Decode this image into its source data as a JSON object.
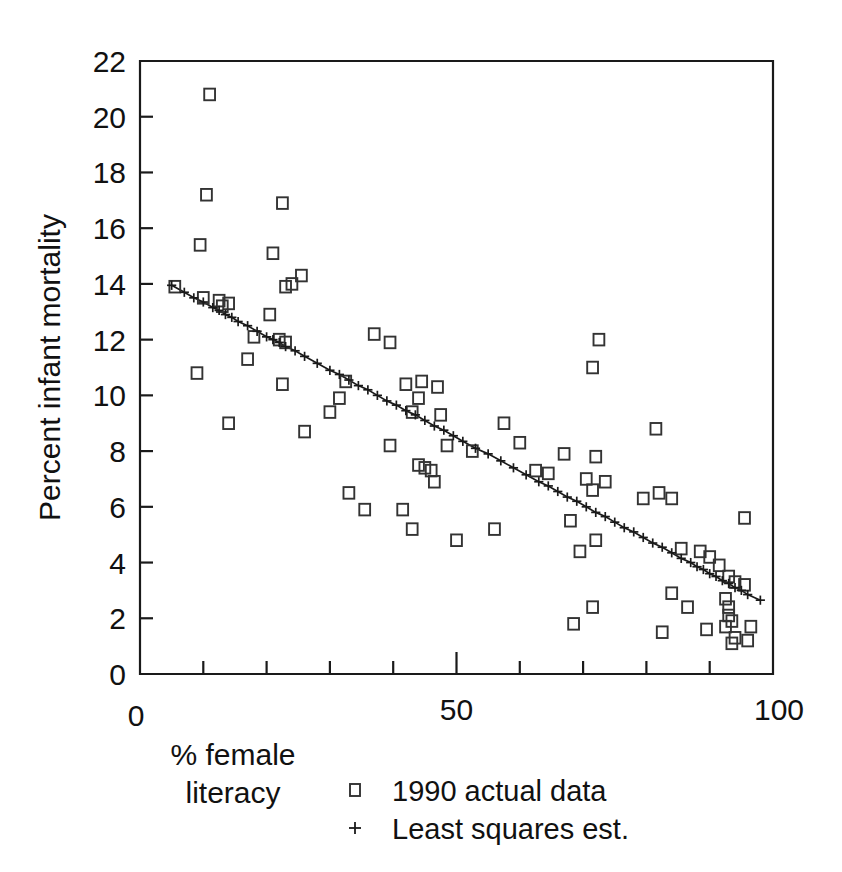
{
  "chart_data": {
    "type": "scatter",
    "title": "",
    "xlabel": "% female literacy",
    "xlabel_lines": [
      "% female",
      "literacy"
    ],
    "ylabel": "Percent infant mortality",
    "xlim": [
      0,
      100
    ],
    "ylim": [
      0,
      22
    ],
    "xticks_major": [
      0,
      50,
      100
    ],
    "xticks_major_labels": [
      "0",
      "50",
      "100"
    ],
    "xticks_minor": [
      10,
      20,
      30,
      40,
      60,
      70,
      80,
      90
    ],
    "yticks": [
      0,
      2,
      4,
      6,
      8,
      10,
      12,
      14,
      16,
      18,
      20,
      22
    ],
    "yticks_labels": [
      "0",
      "2",
      "4",
      "6",
      "8",
      "10",
      "12",
      "14",
      "16",
      "18",
      "20",
      "22"
    ],
    "grid": false,
    "frame": "box",
    "legend_position": "below-axes-right",
    "legend": [
      {
        "marker": "square",
        "label": "1990 actual data"
      },
      {
        "marker": "plus",
        "label": "Least squares est."
      }
    ],
    "series": [
      {
        "name": "1990 actual data",
        "marker": "square",
        "points": [
          [
            11.0,
            20.8
          ],
          [
            10.5,
            17.2
          ],
          [
            22.5,
            16.9
          ],
          [
            9.5,
            15.4
          ],
          [
            21.0,
            15.1
          ],
          [
            25.5,
            14.3
          ],
          [
            24.0,
            14.0
          ],
          [
            23.0,
            13.9
          ],
          [
            5.5,
            13.9
          ],
          [
            10.0,
            13.5
          ],
          [
            12.5,
            13.4
          ],
          [
            14.0,
            13.3
          ],
          [
            13.0,
            13.2
          ],
          [
            20.5,
            12.9
          ],
          [
            37.0,
            12.2
          ],
          [
            39.5,
            11.9
          ],
          [
            72.5,
            12.0
          ],
          [
            18.0,
            12.1
          ],
          [
            22.0,
            12.0
          ],
          [
            23.0,
            11.9
          ],
          [
            71.5,
            11.0
          ],
          [
            17.0,
            11.3
          ],
          [
            22.5,
            10.4
          ],
          [
            32.5,
            10.5
          ],
          [
            42.0,
            10.4
          ],
          [
            44.5,
            10.5
          ],
          [
            47.0,
            10.3
          ],
          [
            9.0,
            10.8
          ],
          [
            31.5,
            9.9
          ],
          [
            44.0,
            9.9
          ],
          [
            14.0,
            9.0
          ],
          [
            26.0,
            8.7
          ],
          [
            30.0,
            9.4
          ],
          [
            43.0,
            9.4
          ],
          [
            47.5,
            9.3
          ],
          [
            48.5,
            8.2
          ],
          [
            57.5,
            9.0
          ],
          [
            81.5,
            8.8
          ],
          [
            39.5,
            8.2
          ],
          [
            52.5,
            8.0
          ],
          [
            60.0,
            8.3
          ],
          [
            67.0,
            7.9
          ],
          [
            72.0,
            7.8
          ],
          [
            44.0,
            7.5
          ],
          [
            45.0,
            7.4
          ],
          [
            46.0,
            7.3
          ],
          [
            62.5,
            7.3
          ],
          [
            64.5,
            7.2
          ],
          [
            70.5,
            7.0
          ],
          [
            73.5,
            6.9
          ],
          [
            71.5,
            6.6
          ],
          [
            33.0,
            6.5
          ],
          [
            35.5,
            5.9
          ],
          [
            41.5,
            5.9
          ],
          [
            46.5,
            6.9
          ],
          [
            43.0,
            5.2
          ],
          [
            56.0,
            5.2
          ],
          [
            50.0,
            4.8
          ],
          [
            68.0,
            5.5
          ],
          [
            72.0,
            4.8
          ],
          [
            69.5,
            4.4
          ],
          [
            79.5,
            6.3
          ],
          [
            82.0,
            6.5
          ],
          [
            84.0,
            6.3
          ],
          [
            95.5,
            5.6
          ],
          [
            85.5,
            4.5
          ],
          [
            88.5,
            4.4
          ],
          [
            90.0,
            4.2
          ],
          [
            91.5,
            3.9
          ],
          [
            93.0,
            3.5
          ],
          [
            94.0,
            3.3
          ],
          [
            95.5,
            3.2
          ],
          [
            84.0,
            2.9
          ],
          [
            86.5,
            2.4
          ],
          [
            92.5,
            2.7
          ],
          [
            93.0,
            2.4
          ],
          [
            93.0,
            2.1
          ],
          [
            93.5,
            1.9
          ],
          [
            92.5,
            1.7
          ],
          [
            94.0,
            1.3
          ],
          [
            93.5,
            1.1
          ],
          [
            96.5,
            1.7
          ],
          [
            89.5,
            1.6
          ],
          [
            82.5,
            1.5
          ],
          [
            68.5,
            1.8
          ],
          [
            71.5,
            2.4
          ],
          [
            96.0,
            1.2
          ]
        ]
      },
      {
        "name": "Least squares est.",
        "marker": "plus",
        "line": true,
        "intercept": 14.55,
        "slope": -0.1215,
        "x_range": [
          5,
          98
        ],
        "points": [
          [
            5.0,
            13.95
          ],
          [
            7.0,
            13.7
          ],
          [
            8.5,
            13.5
          ],
          [
            10.0,
            13.35
          ],
          [
            11.5,
            13.15
          ],
          [
            12.5,
            13.05
          ],
          [
            13.5,
            12.9
          ],
          [
            14.5,
            12.8
          ],
          [
            15.5,
            12.65
          ],
          [
            17.0,
            12.5
          ],
          [
            18.5,
            12.3
          ],
          [
            20.0,
            12.1
          ],
          [
            21.0,
            12.0
          ],
          [
            22.0,
            11.9
          ],
          [
            23.0,
            11.75
          ],
          [
            24.5,
            11.6
          ],
          [
            26.0,
            11.4
          ],
          [
            28.0,
            11.15
          ],
          [
            30.0,
            10.9
          ],
          [
            31.5,
            10.75
          ],
          [
            33.0,
            10.55
          ],
          [
            34.5,
            10.35
          ],
          [
            36.0,
            10.2
          ],
          [
            37.5,
            10.0
          ],
          [
            39.0,
            9.8
          ],
          [
            40.5,
            9.65
          ],
          [
            42.0,
            9.45
          ],
          [
            43.5,
            9.3
          ],
          [
            45.0,
            9.1
          ],
          [
            46.5,
            8.9
          ],
          [
            48.0,
            8.75
          ],
          [
            49.5,
            8.55
          ],
          [
            51.0,
            8.35
          ],
          [
            53.0,
            8.1
          ],
          [
            55.0,
            7.9
          ],
          [
            57.0,
            7.65
          ],
          [
            59.0,
            7.4
          ],
          [
            61.0,
            7.15
          ],
          [
            63.0,
            6.9
          ],
          [
            64.5,
            6.75
          ],
          [
            66.0,
            6.55
          ],
          [
            67.5,
            6.35
          ],
          [
            69.0,
            6.2
          ],
          [
            70.5,
            6.0
          ],
          [
            72.0,
            5.8
          ],
          [
            73.5,
            5.65
          ],
          [
            75.0,
            5.45
          ],
          [
            76.5,
            5.25
          ],
          [
            78.0,
            5.1
          ],
          [
            79.5,
            4.9
          ],
          [
            81.0,
            4.7
          ],
          [
            82.5,
            4.55
          ],
          [
            84.0,
            4.35
          ],
          [
            85.5,
            4.15
          ],
          [
            87.0,
            4.0
          ],
          [
            88.0,
            3.85
          ],
          [
            89.0,
            3.75
          ],
          [
            90.0,
            3.6
          ],
          [
            91.0,
            3.5
          ],
          [
            92.0,
            3.35
          ],
          [
            93.0,
            3.25
          ],
          [
            94.0,
            3.1
          ],
          [
            95.0,
            3.0
          ],
          [
            96.0,
            2.85
          ],
          [
            98.0,
            2.65
          ]
        ]
      }
    ]
  }
}
